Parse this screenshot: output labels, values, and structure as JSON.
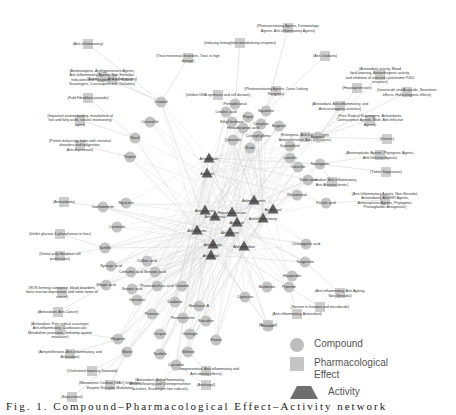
{
  "figure": {
    "type": "network-diagram",
    "caption": "Fig. 1. Compound–Pharmacological Effect–Activity network"
  },
  "legend": {
    "items": [
      {
        "shape": "circle",
        "label": "Compound",
        "color": "#bdbdbd"
      },
      {
        "shape": "square",
        "label": "Pharmacological Effect",
        "color": "#c4c4c4"
      },
      {
        "shape": "triangle",
        "label": "Activity",
        "color": "#6e6e6e"
      }
    ]
  },
  "colors": {
    "edge": "#d6d6d6",
    "compound": "#bdbdbd",
    "effect": "#c4c4c4",
    "activity": "#5e5e5e",
    "label": "#333333"
  },
  "effects": [
    {
      "x": 288,
      "y": 28,
      "label": "(Photosensitizing Agents, Dermatologic Agents, Anti-Inflammatory Agents)"
    },
    {
      "x": 240,
      "y": 43,
      "label": "(Inducing hemoglobin metabolizing enzymes)"
    },
    {
      "x": 88,
      "y": 44,
      "label": "(Anti-Inflammatory)"
    },
    {
      "x": 325,
      "y": 56,
      "label": "(Anti-Oxidants)"
    },
    {
      "x": 112,
      "y": 79,
      "label": "(Antioxidant, Anti-inflammatory)"
    },
    {
      "x": 188,
      "y": 58,
      "label": "(Treat menstrual disorders, Toxic in high dosage)"
    },
    {
      "x": 102,
      "y": 77,
      "label": "(Antimutagenic, Antihypertensive Agents, Anti-Inflammatory Agents, Non-Steroidal, Indicators and Reagents, Free Radical Scavengers, Carcinogens and Chelators)"
    },
    {
      "x": 380,
      "y": 75,
      "label": "(Antioxidant activity, Blood lipid-lowering, Antiandrogenic activity, and inhibition of selected cytochrome P450 enzymes)"
    },
    {
      "x": 218,
      "y": 95,
      "label": "(Inhibits DNA synthesis and cell division)"
    },
    {
      "x": 276,
      "y": 91,
      "label": "(Photosensitizing Agents, Cross-Linking Reagents)"
    },
    {
      "x": 357,
      "y": 88,
      "label": "(Hepatoprotective)"
    },
    {
      "x": 407,
      "y": 92,
      "label": "(Insecticide and Acaricide, Neurotoxic effects, Hallucinogenic effects)"
    },
    {
      "x": 88,
      "y": 98,
      "label": "(Fold Fibroblast peptoide)"
    },
    {
      "x": 340,
      "y": 106,
      "label": "(Antioxidant, Anti-inflammatory, and Anticarcinogenic activities)"
    },
    {
      "x": 80,
      "y": 120,
      "label": "(Important protein binding, metabolism of fats and fatty acids, natural moisturizing agent)"
    },
    {
      "x": 370,
      "y": 120,
      "label": "(Free Radical Scavengers, Antioxidants, Contraceptive Agents, Male, Anti-Infective Agents)"
    },
    {
      "x": 80,
      "y": 145,
      "label": "(Protein balancing, helps with intestinal disorders and indigestion, Anti-depressant)"
    },
    {
      "x": 305,
      "y": 137,
      "label": "(Estrogenic, Anti-Inflammatory, Antiproliferative, Anti-angiogenic)"
    },
    {
      "x": 387,
      "y": 139,
      "label": "(Diuretic)"
    },
    {
      "x": 380,
      "y": 155,
      "label": "(Antineoplastic Agents, Phytogenic Agents, Anti-Infective Agents)"
    },
    {
      "x": 386,
      "y": 172,
      "label": "(Tumor Suppressor)"
    },
    {
      "x": 332,
      "y": 182,
      "label": "(Antioxidant, Anti-inflammatory, Anti-Atherosclerotic)"
    },
    {
      "x": 64,
      "y": 202,
      "label": "(Antioxidants)"
    },
    {
      "x": 385,
      "y": 200,
      "label": "(Anti-Inflammatory Agents, Non-Steroidal, Antioxidants, Anti-HIV Agents, Antineoplastic Agents, Phytogenic, Prostaglandin Antagonists)"
    },
    {
      "x": 60,
      "y": 234,
      "label": "(Inhibit glucose-6-phosphatase in liver)"
    },
    {
      "x": 60,
      "y": 256,
      "label": "(Dental pulp fibroblast cell proliferation)"
    },
    {
      "x": 62,
      "y": 292,
      "label": "(ROS-forming substance, blood disorders, bone marrow depression, and some forms of cancer)"
    },
    {
      "x": 58,
      "y": 312,
      "label": "(Antioxidant, Anti-Cancer)"
    },
    {
      "x": 60,
      "y": 330,
      "label": "(Antioxidant, Free radical scavenger, Anti-inflammatory, Cardiovascular, Metabolism protection, Immunity system modulator)"
    },
    {
      "x": 70,
      "y": 354,
      "label": "(Antiproliferative, Anti-inflammatory, and Antioxidant)"
    },
    {
      "x": 92,
      "y": 371,
      "label": "(Cholesterol lowering flavonoid)"
    },
    {
      "x": 110,
      "y": 385,
      "label": "(Monoamine Oxidase (MAO) Inhibitors, Enzyme Receptor Modulator)"
    },
    {
      "x": 72,
      "y": 397,
      "label": "(Expectorant)"
    },
    {
      "x": 160,
      "y": 384,
      "label": "(Antioxidant, Anti-inflammatory, Antiproliferating and Chemopreventive activities, Scavenges free radicals)"
    },
    {
      "x": 206,
      "y": 371,
      "label": "(Chemopreventive, Anti-inflammatory and Anti-obesity effects)"
    },
    {
      "x": 206,
      "y": 385,
      "label": "(Antifungal)"
    },
    {
      "x": 340,
      "y": 293,
      "label": "(Anti-inflammatory, Anti-Ageing, Non-Steroidal)"
    },
    {
      "x": 320,
      "y": 307,
      "label": "(Seizure in humans and microbicide)"
    },
    {
      "x": 297,
      "y": 314,
      "label": "(Anti-inflammatory, Antioxidant)"
    },
    {
      "x": 268,
      "y": 325,
      "label": "(Antifungal)"
    }
  ],
  "activities": [
    {
      "x": 209,
      "y": 158,
      "label": "Antioxidant"
    },
    {
      "x": 207,
      "y": 173,
      "label": "Antiviral"
    },
    {
      "x": 273,
      "y": 209,
      "label": "Antifungal"
    },
    {
      "x": 263,
      "y": 218,
      "label": "Antiinflammatory"
    },
    {
      "x": 215,
      "y": 216,
      "label": "Antibacterial"
    },
    {
      "x": 230,
      "y": 232,
      "label": "Anticancer"
    },
    {
      "x": 197,
      "y": 230,
      "label": "Antidiabetic"
    },
    {
      "x": 213,
      "y": 244,
      "label": "Antiallergic"
    },
    {
      "x": 237,
      "y": 222,
      "label": "Antiulcer"
    },
    {
      "x": 244,
      "y": 246,
      "label": "Antimicrobial"
    },
    {
      "x": 211,
      "y": 255,
      "label": "Analgesic"
    },
    {
      "x": 232,
      "y": 212,
      "label": "Hepatoprotective"
    },
    {
      "x": 254,
      "y": 200,
      "label": "Antimutagenic"
    },
    {
      "x": 205,
      "y": 210,
      "label": "Antiparasitic"
    }
  ],
  "compounds": [
    {
      "x": 161,
      "y": 102,
      "label": "Linalool"
    },
    {
      "x": 150,
      "y": 122,
      "label": "Citronellol"
    },
    {
      "x": 135,
      "y": 138,
      "label": "Nerol"
    },
    {
      "x": 130,
      "y": 157,
      "label": "Thymol"
    },
    {
      "x": 235,
      "y": 104,
      "label": "Pentadecanal"
    },
    {
      "x": 226,
      "y": 112,
      "label": "Linoleic acid"
    },
    {
      "x": 232,
      "y": 122,
      "label": "Ethyl linoleate"
    },
    {
      "x": 248,
      "y": 117,
      "label": "Phytol"
    },
    {
      "x": 266,
      "y": 111,
      "label": "Squalene"
    },
    {
      "x": 261,
      "y": 124,
      "label": "Camphor"
    },
    {
      "x": 243,
      "y": 128,
      "label": "Hexadecanoic acid"
    },
    {
      "x": 279,
      "y": 126,
      "label": "Eugenol"
    },
    {
      "x": 258,
      "y": 136,
      "label": "Caryophyllene"
    },
    {
      "x": 233,
      "y": 140,
      "label": "Quercetin"
    },
    {
      "x": 250,
      "y": 148,
      "label": "Rutin"
    },
    {
      "x": 290,
      "y": 146,
      "label": "Kaempferol"
    },
    {
      "x": 318,
      "y": 137,
      "label": "Apigenin"
    },
    {
      "x": 290,
      "y": 158,
      "label": "Luteolin"
    },
    {
      "x": 298,
      "y": 167,
      "label": "Catechin"
    },
    {
      "x": 320,
      "y": 164,
      "label": "Naringenin"
    },
    {
      "x": 308,
      "y": 180,
      "label": "Gallic acid"
    },
    {
      "x": 297,
      "y": 195,
      "label": "Resveratrol"
    },
    {
      "x": 326,
      "y": 203,
      "label": "Ferulic acid"
    },
    {
      "x": 306,
      "y": 244,
      "label": "Chlorogenic acid"
    },
    {
      "x": 305,
      "y": 262,
      "label": "Tangeretin"
    },
    {
      "x": 292,
      "y": 276,
      "label": "Hesperidin"
    },
    {
      "x": 126,
      "y": 203,
      "label": "Myricetin"
    },
    {
      "x": 103,
      "y": 207,
      "label": "Isorhamnetin"
    },
    {
      "x": 117,
      "y": 227,
      "label": "Coumarin"
    },
    {
      "x": 105,
      "y": 248,
      "label": "Vanillin"
    },
    {
      "x": 111,
      "y": 266,
      "label": "Syringic acid"
    },
    {
      "x": 147,
      "y": 261,
      "label": "Caffeic acid"
    },
    {
      "x": 131,
      "y": 272,
      "label": "Cinnamic acid"
    },
    {
      "x": 155,
      "y": 272,
      "label": "Benzoic acid"
    },
    {
      "x": 106,
      "y": 285,
      "label": "Ellagic acid"
    },
    {
      "x": 132,
      "y": 289,
      "label": "Sinapic acid"
    },
    {
      "x": 157,
      "y": 286,
      "label": "Protocatechuic acid"
    },
    {
      "x": 182,
      "y": 286,
      "label": "Diosmin"
    },
    {
      "x": 137,
      "y": 300,
      "label": "Genistein"
    },
    {
      "x": 175,
      "y": 302,
      "label": "Daidzein"
    },
    {
      "x": 199,
      "y": 306,
      "label": "Biochanin A"
    },
    {
      "x": 152,
      "y": 314,
      "label": "Puerarin"
    },
    {
      "x": 183,
      "y": 318,
      "label": "Formononetin"
    },
    {
      "x": 206,
      "y": 321,
      "label": "Baicalein"
    },
    {
      "x": 118,
      "y": 339,
      "label": "Wogonin"
    },
    {
      "x": 160,
      "y": 334,
      "label": "Chrysin"
    },
    {
      "x": 190,
      "y": 334,
      "label": "Galangin"
    },
    {
      "x": 216,
      "y": 340,
      "label": "Fisetin"
    },
    {
      "x": 127,
      "y": 352,
      "label": "Morin"
    },
    {
      "x": 160,
      "y": 354,
      "label": "Taxifolin"
    },
    {
      "x": 188,
      "y": 352,
      "label": "Silibinin"
    },
    {
      "x": 176,
      "y": 365,
      "label": "Curcumin"
    },
    {
      "x": 267,
      "y": 287,
      "label": "Berberine"
    },
    {
      "x": 289,
      "y": 287,
      "label": "Piperine"
    },
    {
      "x": 245,
      "y": 297,
      "label": "Capsaicin"
    },
    {
      "x": 268,
      "y": 326,
      "label": "Emodin"
    }
  ]
}
